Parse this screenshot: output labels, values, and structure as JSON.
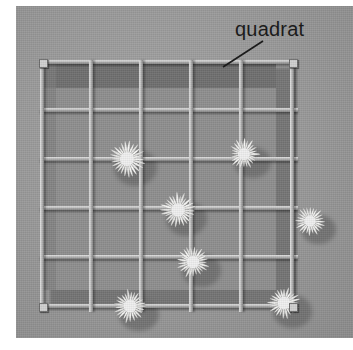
{
  "figure": {
    "kind": "photograph-with-callout",
    "palette": {
      "page_background": "#ffffff",
      "ground_gray": "#9a9a9a",
      "quadrat_interior_gray": "#8e8e8e",
      "deep_shadow_gray": "#6e6e6e",
      "cast_shadow_gray": "#6f6f6f",
      "wire_light": "#e2e2e2",
      "wire_dark": "#7e7e7e",
      "flower_white": "#f6f6f6",
      "label_text": "#1b1b1b"
    }
  },
  "callout": {
    "label": "quadrat",
    "leader_icon": "leader-line-icon",
    "leader_from": "label lower-left",
    "leader_to": "top rail of quadrat frame"
  },
  "quadrat": {
    "name": "quadrat-frame",
    "shape": "square",
    "grid_columns": 5,
    "grid_rows": 5,
    "horizontal_wires": 6,
    "vertical_wires": 6,
    "corner_posts": 4,
    "wire_color": "#bdbdbd",
    "horizontal_wire_y": [
      2,
      50,
      99,
      148,
      197,
      246
    ],
    "vertical_wire_x": [
      2,
      51,
      101,
      151,
      201,
      252
    ],
    "post_positions": [
      {
        "x": 1,
        "y": 1
      },
      {
        "x": 251,
        "y": 1
      },
      {
        "x": 1,
        "y": 245
      },
      {
        "x": 251,
        "y": 245
      }
    ]
  },
  "flowers": {
    "name": "daisy-flowers",
    "count": 7,
    "items": [
      {
        "id": "flower-1",
        "grid_cell": "row1-col2",
        "cx": 89,
        "cy": 101,
        "r": 27,
        "petals": 26,
        "note": "upper-left, straddles wire intersection"
      },
      {
        "id": "flower-2",
        "grid_cell": "row1-col4",
        "cx": 206,
        "cy": 96,
        "r": 23,
        "petals": 24,
        "note": "upper-right"
      },
      {
        "id": "flower-3",
        "grid_cell": "row2-col3",
        "cx": 140,
        "cy": 152,
        "r": 26,
        "petals": 26,
        "note": "centre-left of middle"
      },
      {
        "id": "flower-4",
        "grid_cell": "row3-col3",
        "cx": 155,
        "cy": 204,
        "r": 24,
        "petals": 25,
        "note": "centre"
      },
      {
        "id": "flower-5",
        "grid_cell": "row4-col1",
        "cx": 92,
        "cy": 248,
        "r": 25,
        "petals": 25,
        "note": "lower-left"
      },
      {
        "id": "flower-6",
        "grid_cell": "row4-col5",
        "cx": 246,
        "cy": 245,
        "r": 24,
        "petals": 24,
        "note": "lower-right"
      },
      {
        "id": "flower-7",
        "grid_cell": "row2-col5-edge",
        "cx": 272,
        "cy": 163,
        "r": 22,
        "petals": 24,
        "note": "straddles the right frame edge, partly outside"
      }
    ]
  }
}
